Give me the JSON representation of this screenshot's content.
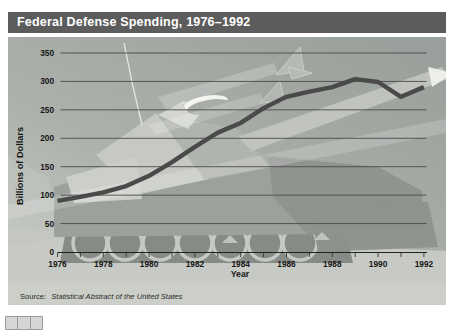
{
  "header": {
    "title": "Federal Defense Spending, 1976–1992",
    "bg_color": "#5c5c5c",
    "text_color": "#ffffff"
  },
  "chart_data": {
    "type": "line",
    "title": "Federal Defense Spending, 1976–1992",
    "xlabel": "Year",
    "ylabel": "Billions of Dollars",
    "x": [
      1976,
      1977,
      1978,
      1979,
      1980,
      1981,
      1982,
      1983,
      1984,
      1985,
      1986,
      1987,
      1988,
      1989,
      1990,
      1991,
      1992
    ],
    "values": [
      90,
      97,
      105,
      116,
      134,
      158,
      185,
      210,
      227,
      253,
      273,
      282,
      290,
      304,
      299,
      273,
      290
    ],
    "ylim": [
      0,
      350
    ],
    "xlim": [
      1976,
      1992
    ],
    "yticks": [
      0,
      50,
      100,
      150,
      200,
      250,
      300,
      350
    ],
    "xticks_labeled": [
      1976,
      1978,
      1980,
      1982,
      1984,
      1986,
      1988,
      1990,
      1992
    ],
    "grid": "horizontal",
    "legend": "none",
    "line_color": "#4a4a4a",
    "gridline_color": "#4b4b4b",
    "source_prefix": "Source:",
    "source_text": "Statistical Abstract of the United States"
  },
  "background_art": {
    "tank_icon": "tank-illustration",
    "jets_icon": "fighter-jets",
    "barrel_icon": "gun-barrel-streak",
    "panel_gradient": [
      "#cdd0ca",
      "#9aa09b"
    ]
  },
  "footer": {
    "partial_icon": "partial-table-icon"
  }
}
